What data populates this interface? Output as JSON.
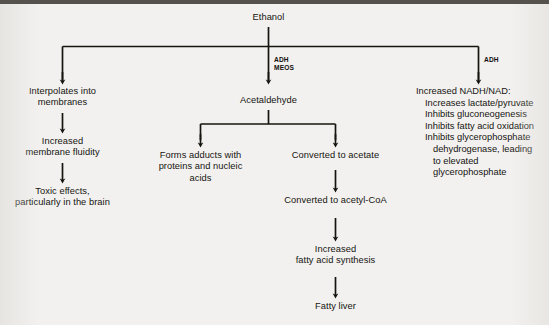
{
  "diagram": {
    "root": {
      "label": "Ethanol"
    },
    "enzyme_labels": {
      "middle": "ADH\nMEOS",
      "right": "ADH"
    },
    "branches": {
      "left": [
        {
          "label": "Interpolates into\nmembranes"
        },
        {
          "label": "Increased\nmembrane fluidity"
        },
        {
          "label": "Toxic effects,\nparticularly in the brain"
        }
      ],
      "middle": {
        "head": {
          "label": "Acetaldehyde"
        },
        "left_leaf": {
          "label": "Forms adducts with\nproteins and nucleic\nacids"
        },
        "chain": [
          {
            "label": "Converted to acetate"
          },
          {
            "label": "Converted to acetyl-CoA"
          },
          {
            "label": "Increased\nfatty acid synthesis"
          },
          {
            "label": "Fatty liver"
          }
        ]
      },
      "right": {
        "head": "Increased NADH/NAD:",
        "items": [
          {
            "text": "Increases lactate/pyruvate",
            "continuation": []
          },
          {
            "text": "Inhibits gluconeogenesis",
            "continuation": []
          },
          {
            "text": "Inhibits fatty acid oxidation",
            "continuation": []
          },
          {
            "text": "Inhibits glycerophosphate",
            "continuation": [
              "dehydrogenase, leading",
              "to elevated",
              "glycerophosphate"
            ]
          }
        ]
      }
    }
  },
  "colors": {
    "ink": "#15140f",
    "background": "#f2f1ef",
    "rule": "#55514c"
  }
}
